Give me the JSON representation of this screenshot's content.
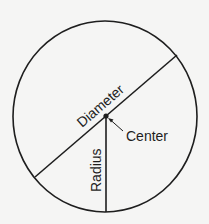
{
  "diagram": {
    "labels": {
      "diameter": "Diameter",
      "center": "Center",
      "radius": "Radius"
    },
    "colors": {
      "background": "#f5f5f4",
      "stroke": "#1e1e1e"
    },
    "geometry": {
      "circle": {
        "cx": 105,
        "cy": 116.5,
        "rx": 92,
        "ry": 95.5
      },
      "center_point": {
        "x": 106,
        "y": 116
      },
      "diameter_line": {
        "x1": 35,
        "y1": 177,
        "x2": 177,
        "y2": 55
      },
      "radius_line": {
        "x1": 106,
        "y1": 116,
        "x2": 106,
        "y2": 212
      },
      "center_arrow": {
        "from": [
          123,
          131
        ],
        "to": [
          108,
          118
        ]
      }
    }
  }
}
